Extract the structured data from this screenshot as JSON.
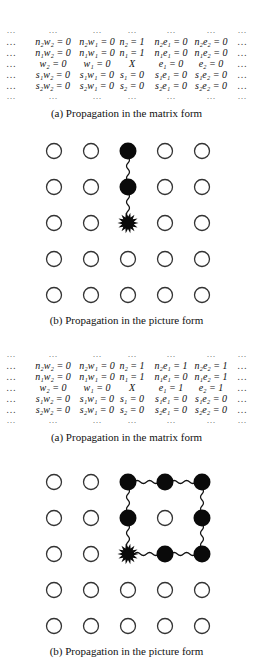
{
  "figures": [
    {
      "matrix": {
        "top": 25,
        "rows": [
          [
            "…",
            "…",
            "…",
            "…",
            "…",
            "…",
            "…"
          ],
          [
            "…",
            "n₂w₂ = 0",
            "n₂w₁ = 0",
            "n₂ = 1",
            "n₂e₁ = 0",
            "n₂e₂ = 0",
            "…"
          ],
          [
            "…",
            "n₁w₂ = 0",
            "n₁w₁ = 0",
            "n₁ = 1",
            "n₁e₁ = 0",
            "n₁e₂ = 0",
            "…"
          ],
          [
            "…",
            "w₂ = 0",
            "w₁ = 0",
            "X",
            "e₁ = 0",
            "e₂ = 0",
            "…"
          ],
          [
            "…",
            "s₁w₂ = 0",
            "s₁w₁ = 0",
            "s₁ = 0",
            "s₁e₁ = 0",
            "s₁e₂ = 0",
            "…"
          ],
          [
            "…",
            "s₂w₂ = 0",
            "s₂w₁ = 0",
            "s₂ = 0",
            "s₂e₁ = 0",
            "s₂e₂ = 0",
            "…"
          ],
          [
            "…",
            "…",
            "…",
            "…",
            "…",
            "…",
            "…"
          ]
        ],
        "caption": "(a) Propagation in the matrix form",
        "caption_top": 107
      },
      "grid": {
        "top": 133,
        "rows_y": [
          18,
          54,
          90,
          126,
          162
        ],
        "cols_x": [
          54,
          91,
          128,
          165,
          202
        ],
        "cells": [
          [
            "empty",
            "empty",
            "filled",
            "empty",
            "empty"
          ],
          [
            "empty",
            "empty",
            "filled",
            "empty",
            "empty"
          ],
          [
            "empty",
            "empty",
            "burst",
            "empty",
            "empty"
          ],
          [
            "empty",
            "empty",
            "empty",
            "empty",
            "empty"
          ],
          [
            "empty",
            "empty",
            "empty",
            "empty",
            "empty"
          ]
        ],
        "links": [
          [
            [
              0,
              2
            ],
            [
              1,
              2
            ]
          ],
          [
            [
              1,
              2
            ],
            [
              2,
              2
            ]
          ]
        ],
        "caption": "(b) Propagation in the picture form",
        "caption_top": 314
      }
    },
    {
      "matrix": {
        "top": 349,
        "rows": [
          [
            "…",
            "…",
            "…",
            "…",
            "…",
            "…",
            "…"
          ],
          [
            "…",
            "n₂w₂ = 0",
            "n₂w₁ = 0",
            "n₂ = 1",
            "n₂e₁ = 1",
            "n₂e₂ = 1",
            "…"
          ],
          [
            "…",
            "n₁w₂ = 0",
            "n₁w₁ = 0",
            "n₁ = 1",
            "n₁e₁ = 0",
            "n₁e₂ = 1",
            "…"
          ],
          [
            "…",
            "w₂ = 0",
            "w₁ = 0",
            "X",
            "e₁ = 1",
            "e₂ = 1",
            "…"
          ],
          [
            "…",
            "s₁w₂ = 0",
            "s₁w₁ = 0",
            "s₁ = 0",
            "s₁e₁ = 0",
            "s₁e₂ = 0",
            "…"
          ],
          [
            "…",
            "s₂w₂ = 0",
            "s₂w₁ = 0",
            "s₂ = 0",
            "s₂e₁ = 0",
            "s₂e₂ = 0",
            "…"
          ],
          [
            "…",
            "…",
            "…",
            "…",
            "…",
            "…",
            "…"
          ]
        ],
        "caption": "(a) Propagation in the matrix form",
        "caption_top": 431
      },
      "grid": {
        "top": 464,
        "rows_y": [
          18,
          54,
          90,
          126,
          162
        ],
        "cols_x": [
          54,
          91,
          128,
          165,
          202
        ],
        "cells": [
          [
            "empty",
            "empty",
            "filled",
            "filled",
            "filled"
          ],
          [
            "empty",
            "empty",
            "filled",
            "empty",
            "filled"
          ],
          [
            "empty",
            "empty",
            "burst",
            "filled",
            "filled"
          ],
          [
            "empty",
            "empty",
            "empty",
            "empty",
            "empty"
          ],
          [
            "empty",
            "empty",
            "empty",
            "empty",
            "empty"
          ]
        ],
        "links": [
          [
            [
              0,
              2
            ],
            [
              0,
              3
            ]
          ],
          [
            [
              0,
              3
            ],
            [
              0,
              4
            ]
          ],
          [
            [
              0,
              4
            ],
            [
              1,
              4
            ]
          ],
          [
            [
              1,
              4
            ],
            [
              2,
              4
            ]
          ],
          [
            [
              2,
              4
            ],
            [
              2,
              3
            ]
          ],
          [
            [
              2,
              3
            ],
            [
              2,
              2
            ]
          ],
          [
            [
              2,
              2
            ],
            [
              1,
              2
            ]
          ],
          [
            [
              1,
              2
            ],
            [
              0,
              2
            ]
          ]
        ],
        "caption": "(b) Propagation in the picture form",
        "caption_top": 645
      }
    }
  ]
}
